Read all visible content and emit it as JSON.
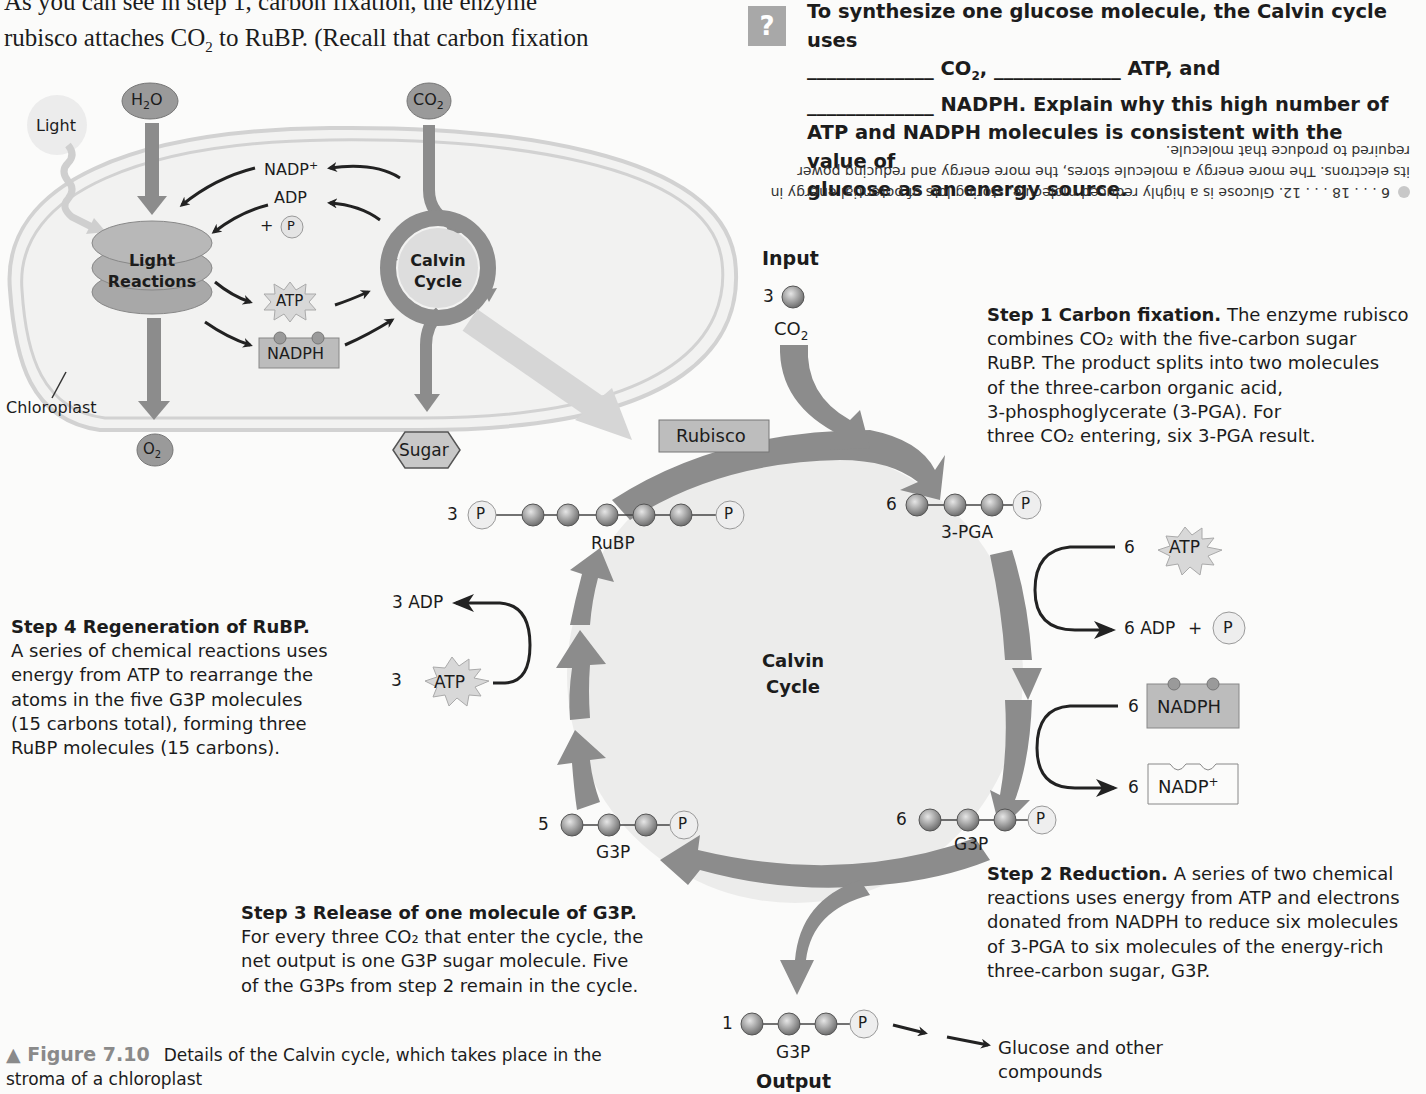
{
  "body_text": {
    "line1": "As you can see in step 1, carbon fixation, the enzyme",
    "line2_a": "rubisco attaches CO",
    "line2_sub": "2",
    "line2_b": " to RuBP. (Recall that carbon fixation"
  },
  "question": {
    "icon": "?",
    "line1": "To synthesize one glucose molecule, the Calvin cycle uses",
    "blank": "_____________",
    "co2": "CO",
    "co2_sub": "2",
    "co2_comma": ",",
    "atp_and": "ATP, and",
    "nadph_rest": "NADPH. Explain why this high number of",
    "line4": "ATP and NADPH molecules is consistent with the value of",
    "line5": "glucose as an energy source.",
    "answer_upside_down": "6 . . . 18 . . . 12. Glucose is a highly reduced molecule, storing lots of potential energy in its electrons. The more energy a molecule stores, the more energy and reducing power required to produce that molecule."
  },
  "overview": {
    "light": "Light",
    "h2o": "H",
    "h2o_sub": "2",
    "h2o_end": "O",
    "co2": "CO",
    "co2_sub": "2",
    "nadp_plus": "NADP",
    "plus_sup": "+",
    "adp": "ADP",
    "plus": "+",
    "p": "P",
    "light_reactions_1": "Light",
    "light_reactions_2": "Reactions",
    "calvin_1": "Calvin",
    "calvin_2": "Cycle",
    "atp": "ATP",
    "nadph": "NADPH",
    "chloroplast": "Chloroplast",
    "o2": "O",
    "o2_sub": "2",
    "sugar": "Sugar"
  },
  "cycle": {
    "input_label": "Input",
    "input_count": "3",
    "input_co2": "CO",
    "input_co2_sub": "2",
    "rubisco": "Rubisco",
    "center_1": "Calvin",
    "center_2": "Cycle",
    "rubp_count": "3",
    "rubp_label": "RuBP",
    "pga_count": "6",
    "pga_label": "3-PGA",
    "g3p6_count": "6",
    "g3p6_label": "G3P",
    "g3p5_count": "5",
    "g3p5_label": "G3P",
    "g3p1_count": "1",
    "g3p1_label": "G3P",
    "output_label": "Output",
    "glucose_1": "Glucose and other",
    "glucose_2": "compounds",
    "p": "P",
    "atp6_count": "6",
    "atp": "ATP",
    "adp6": "6 ADP",
    "plus": "+",
    "nadph6_count": "6",
    "nadph": "NADPH",
    "nadp6_count": "6",
    "nadp": "NADP",
    "nadp_sup": "+",
    "adp3": "3 ADP",
    "atp3_count": "3"
  },
  "steps": {
    "step1_title": "Step 1 Carbon fixation.",
    "step1_lines": [
      " The enzyme rubisco",
      "combines CO₂ with the five-carbon sugar",
      "RuBP. The product splits into two molecules",
      "of the three-carbon organic acid,",
      "3-phosphoglycerate (3-PGA). For",
      "three CO₂ entering, six 3-PGA result."
    ],
    "step2_title": "Step 2 Reduction.",
    "step2_lines": [
      " A series of two chemical",
      "reactions uses energy from ATP and electrons",
      "donated from NADPH to reduce six molecules",
      "of 3-PGA to six molecules of the energy-rich",
      "three-carbon sugar, G3P."
    ],
    "step3_title": "Step 3 Release of one molecule of G3P.",
    "step3_lines": [
      "For every three CO₂ that enter the cycle, the",
      "net output is one G3P sugar molecule. Five",
      "of the G3Ps from step 2 remain in the cycle."
    ],
    "step4_title": "Step 4 Regeneration of RuBP.",
    "step4_lines": [
      "A series of chemical reactions uses",
      "energy from ATP to rearrange the",
      "atoms in the five G3P molecules",
      "(15 carbons total), forming three",
      "RuBP molecules (15 carbons)."
    ]
  },
  "caption": {
    "marker": "▲",
    "figure": "Figure 7.10",
    "text": "Details of the Calvin cycle, which takes place in the",
    "text2": "stroma of a chloroplast"
  },
  "colors": {
    "arrow_gray": "#8c8c8c",
    "light_gray": "#c8c8c8",
    "circle_fill": "#ebebea",
    "box_fill": "#b4b4b4",
    "atp_fill": "#d8d8d8"
  }
}
